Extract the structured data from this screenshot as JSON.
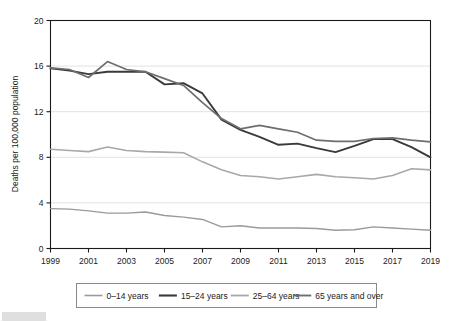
{
  "chart_data": {
    "type": "line",
    "title": "",
    "xlabel": "",
    "ylabel": "Deaths per 100,000 population",
    "x": [
      1999,
      2000,
      2001,
      2002,
      2003,
      2004,
      2005,
      2006,
      2007,
      2008,
      2009,
      2010,
      2011,
      2012,
      2013,
      2014,
      2015,
      2016,
      2017,
      2018,
      2019
    ],
    "xlim": [
      1999,
      2019
    ],
    "ylim": [
      0,
      20
    ],
    "yticks": [
      0,
      4,
      8,
      12,
      16,
      20
    ],
    "xticks": [
      1999,
      2001,
      2003,
      2005,
      2007,
      2009,
      2011,
      2013,
      2015,
      2017,
      2019
    ],
    "grid": "horizontal",
    "legend_position": "bottom",
    "series": [
      {
        "name": "0–14 years",
        "color": "#9a9a9a",
        "width": 1.4,
        "values": [
          3.5,
          3.45,
          3.3,
          3.1,
          3.1,
          3.2,
          2.9,
          2.75,
          2.55,
          1.9,
          2.0,
          1.8,
          1.8,
          1.8,
          1.75,
          1.6,
          1.65,
          1.9,
          1.8,
          1.7,
          1.6
        ]
      },
      {
        "name": "15–24 years",
        "color": "#3a3a3a",
        "width": 1.9,
        "values": [
          15.8,
          15.6,
          15.3,
          15.5,
          15.5,
          15.5,
          14.4,
          14.5,
          13.6,
          11.3,
          10.4,
          9.8,
          9.1,
          9.2,
          8.8,
          8.45,
          9.0,
          9.6,
          9.6,
          8.9,
          8.0
        ]
      },
      {
        "name": "25–64 years",
        "color": "#a8a8a8",
        "width": 1.6,
        "values": [
          8.7,
          8.6,
          8.5,
          8.9,
          8.6,
          8.5,
          8.45,
          8.4,
          7.6,
          6.9,
          6.4,
          6.3,
          6.1,
          6.3,
          6.5,
          6.3,
          6.2,
          6.1,
          6.4,
          7.0,
          6.9
        ]
      },
      {
        "name": "65 years and over",
        "color": "#6e6e6e",
        "width": 1.7,
        "values": [
          15.85,
          15.7,
          15.0,
          16.4,
          15.7,
          15.5,
          14.9,
          14.3,
          12.8,
          11.4,
          10.5,
          10.8,
          10.5,
          10.2,
          9.5,
          9.4,
          9.4,
          9.65,
          9.7,
          9.5,
          9.35
        ]
      }
    ]
  },
  "axis": {
    "ylabel": "Deaths per 100,000 population",
    "ytick_labels": [
      "0",
      "4",
      "8",
      "12",
      "16",
      "20"
    ],
    "xtick_labels": [
      "1999",
      "2001",
      "2003",
      "2005",
      "2007",
      "2009",
      "2011",
      "2013",
      "2015",
      "2017",
      "2019"
    ]
  },
  "legend": {
    "items": [
      {
        "label": "0–14 years"
      },
      {
        "label": "15–24 years"
      },
      {
        "label": "25–64 years"
      },
      {
        "label": "65 years and over"
      }
    ]
  }
}
